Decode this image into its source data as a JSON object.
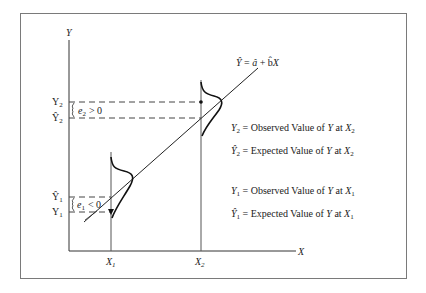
{
  "diagram": {
    "colors": {
      "frame": "#7a7a7a",
      "ink": "#222222",
      "background": "#ffffff"
    },
    "axes": {
      "y_label": "Y",
      "x_label": "X",
      "x_ticks": [
        {
          "base": "X",
          "sub": "1"
        },
        {
          "base": "X",
          "sub": "2"
        }
      ]
    },
    "regression_equation": {
      "lhs": "Ŷ",
      "eq": "=",
      "a": "â",
      "plus": "+",
      "b": "b̂",
      "x": "X"
    },
    "y_markers": {
      "y2": {
        "base": "Y",
        "sub": "2"
      },
      "y2_hat": {
        "base": "Ŷ",
        "sub": "2"
      },
      "y1_hat": {
        "base": "Ŷ",
        "sub": "1"
      },
      "y1": {
        "base": "Y",
        "sub": "1"
      }
    },
    "errors": {
      "e2": {
        "base": "e",
        "sub": "2",
        "rel": "> 0"
      },
      "e1": {
        "base": "e",
        "sub": "1",
        "rel": "< 0"
      }
    },
    "legend": [
      {
        "sym": "Y",
        "hat": false,
        "sub": "2",
        "text": "= Observed Value of",
        "var": "Y",
        "at": "at",
        "xsub": "2"
      },
      {
        "sym": "Ŷ",
        "hat": true,
        "sub": "2",
        "text": "= Expected Value of",
        "var": "Y",
        "at": "at",
        "xsub": "2"
      },
      {
        "sym": "Y",
        "hat": false,
        "sub": "1",
        "text": "= Observed Value of",
        "var": "Y",
        "at": "at",
        "xsub": "1"
      },
      {
        "sym": "Ŷ",
        "hat": true,
        "sub": "1",
        "text": "= Expected Value of",
        "var": "Y",
        "at": "at",
        "xsub": "1"
      }
    ]
  }
}
